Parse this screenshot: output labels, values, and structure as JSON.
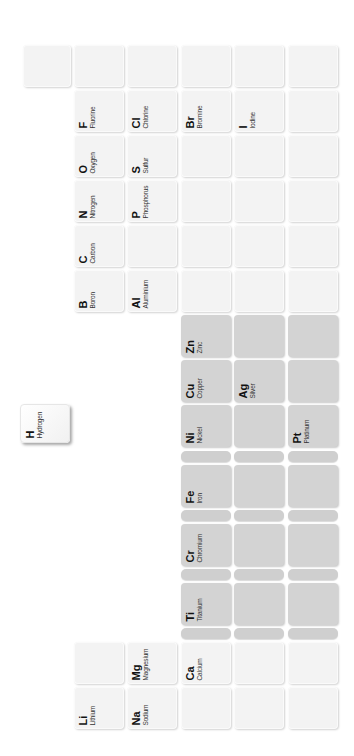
{
  "colors": {
    "background": "#ffffff",
    "tile_light": "#f3f3f3",
    "tile_metal": "#d3d3d3",
    "tile_bar": "#cfcfcf"
  },
  "elements": {
    "H": {
      "symbol": "H",
      "name": "Hydrogen"
    },
    "Li": {
      "symbol": "Li",
      "name": "Lithium"
    },
    "Na": {
      "symbol": "Na",
      "name": "Sodium"
    },
    "Mg": {
      "symbol": "Mg",
      "name": "Magnesium"
    },
    "Ca": {
      "symbol": "Ca",
      "name": "Calcium"
    },
    "Ti": {
      "symbol": "Ti",
      "name": "Titanium"
    },
    "Cr": {
      "symbol": "Cr",
      "name": "Chromium"
    },
    "Fe": {
      "symbol": "Fe",
      "name": "Iron"
    },
    "Ni": {
      "symbol": "Ni",
      "name": "Nickel"
    },
    "Cu": {
      "symbol": "Cu",
      "name": "Copper"
    },
    "Zn": {
      "symbol": "Zn",
      "name": "Zinc"
    },
    "Ag": {
      "symbol": "Ag",
      "name": "Silver"
    },
    "Pt": {
      "symbol": "Pt",
      "name": "Platinum"
    },
    "B": {
      "symbol": "B",
      "name": "Boron"
    },
    "Al": {
      "symbol": "Al",
      "name": "Aluminium"
    },
    "C": {
      "symbol": "C",
      "name": "Carbon"
    },
    "N": {
      "symbol": "N",
      "name": "Nitrogen"
    },
    "P": {
      "symbol": "P",
      "name": "Phosphorus"
    },
    "O": {
      "symbol": "O",
      "name": "Oxygen"
    },
    "S": {
      "symbol": "S",
      "name": "Sulfur"
    },
    "F": {
      "symbol": "F",
      "name": "Fluorine"
    },
    "Cl": {
      "symbol": "Cl",
      "name": "Chlorine"
    },
    "Br": {
      "symbol": "Br",
      "name": "Bromine"
    },
    "I": {
      "symbol": "I",
      "name": "Iodine"
    }
  }
}
